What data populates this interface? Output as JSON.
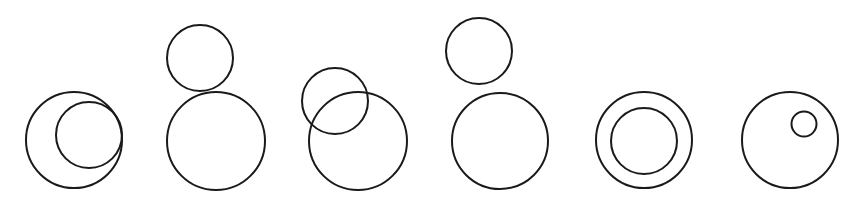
{
  "canvas": {
    "width": 862,
    "height": 204,
    "background": "#ffffff",
    "stroke": "#1a1a1a",
    "stroke_width": 2
  },
  "figures": [
    {
      "id": "internally-tangent",
      "relation": "smaller circle inside larger, touching internally",
      "circles": [
        {
          "role": "large",
          "cx": 74,
          "cy": 140,
          "r": 48
        },
        {
          "role": "small",
          "cx": 89,
          "cy": 135,
          "r": 33
        }
      ]
    },
    {
      "id": "externally-tangent",
      "relation": "smaller circle above larger, touching externally",
      "circles": [
        {
          "role": "small",
          "cx": 200,
          "cy": 58,
          "r": 33
        },
        {
          "role": "large",
          "cx": 216,
          "cy": 141,
          "r": 49
        }
      ]
    },
    {
      "id": "intersecting",
      "relation": "two circles overlapping",
      "circles": [
        {
          "role": "small",
          "cx": 335,
          "cy": 101,
          "r": 33
        },
        {
          "role": "large",
          "cx": 358,
          "cy": 141,
          "r": 49
        }
      ]
    },
    {
      "id": "separate",
      "relation": "smaller circle above larger, not touching",
      "circles": [
        {
          "role": "small",
          "cx": 479,
          "cy": 51,
          "r": 33
        },
        {
          "role": "large",
          "cx": 500,
          "cy": 141,
          "r": 48
        }
      ]
    },
    {
      "id": "concentric",
      "relation": "two circles sharing the same center",
      "circles": [
        {
          "role": "large",
          "cx": 644,
          "cy": 140,
          "r": 48
        },
        {
          "role": "small",
          "cx": 644,
          "cy": 141,
          "r": 33
        }
      ]
    },
    {
      "id": "contained",
      "relation": "tiny circle inside larger, not touching",
      "circles": [
        {
          "role": "large",
          "cx": 790,
          "cy": 140,
          "r": 48
        },
        {
          "role": "small",
          "cx": 804,
          "cy": 124,
          "r": 12.5
        }
      ]
    }
  ]
}
